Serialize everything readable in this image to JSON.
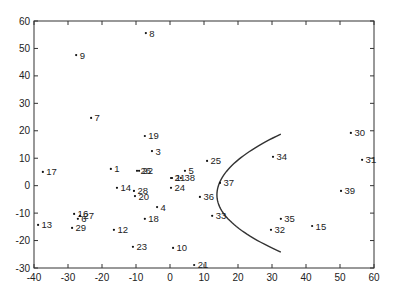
{
  "chart_data": {
    "type": "scatter",
    "title": "",
    "xlabel": "",
    "ylabel": "",
    "xlim": [
      -40,
      60
    ],
    "ylim": [
      -30,
      60
    ],
    "grid": false,
    "legend": null,
    "xticks": [
      -40,
      -30,
      -20,
      -10,
      0,
      10,
      20,
      30,
      40,
      50,
      60
    ],
    "yticks": [
      -30,
      -20,
      -10,
      0,
      10,
      20,
      30,
      40,
      50,
      60
    ],
    "points": [
      {
        "label": "1",
        "x": -17.4,
        "y": 6.1
      },
      {
        "label": "2",
        "x": 0.3,
        "y": 2.8
      },
      {
        "label": "3",
        "x": -5.3,
        "y": 12.6
      },
      {
        "label": "4",
        "x": -3.8,
        "y": -7.8
      },
      {
        "label": "5",
        "x": 4.4,
        "y": 5.4
      },
      {
        "label": "6",
        "x": -27.1,
        "y": -12.1
      },
      {
        "label": "7",
        "x": -23.2,
        "y": 24.7
      },
      {
        "label": "8",
        "x": -7.1,
        "y": 55.6
      },
      {
        "label": "9",
        "x": -27.6,
        "y": 47.6
      },
      {
        "label": "10",
        "x": 0.9,
        "y": -22.7
      },
      {
        "label": "11",
        "x": 0.6,
        "y": 2.8
      },
      {
        "label": "12",
        "x": -16.5,
        "y": -16.1
      },
      {
        "label": "13",
        "x": -38.8,
        "y": -14.3
      },
      {
        "label": "14",
        "x": -15.6,
        "y": -0.8
      },
      {
        "label": "15",
        "x": 41.8,
        "y": -14.7
      },
      {
        "label": "16",
        "x": -28.2,
        "y": -10.3
      },
      {
        "label": "17",
        "x": -37.4,
        "y": 5.0
      },
      {
        "label": "18",
        "x": -7.4,
        "y": -12.1
      },
      {
        "label": "19",
        "x": -7.4,
        "y": 18.1
      },
      {
        "label": "20",
        "x": -10.3,
        "y": -3.8
      },
      {
        "label": "21",
        "x": 7.1,
        "y": -28.9
      },
      {
        "label": "22",
        "x": -9.1,
        "y": 5.4
      },
      {
        "label": "23",
        "x": -10.9,
        "y": -22.3
      },
      {
        "label": "24",
        "x": 0.3,
        "y": -0.8
      },
      {
        "label": "25",
        "x": 10.9,
        "y": 9.0
      },
      {
        "label": "26",
        "x": -9.7,
        "y": 5.4
      },
      {
        "label": "27",
        "x": -26.5,
        "y": -11.0
      },
      {
        "label": "28",
        "x": -10.6,
        "y": -1.9
      },
      {
        "label": "29",
        "x": -28.8,
        "y": -15.4
      },
      {
        "label": "30",
        "x": 53.2,
        "y": 19.2
      },
      {
        "label": "31",
        "x": 56.5,
        "y": 9.4
      },
      {
        "label": "32",
        "x": 29.7,
        "y": -16.1
      },
      {
        "label": "33",
        "x": 12.4,
        "y": -11.0
      },
      {
        "label": "34",
        "x": 30.3,
        "y": 10.5
      },
      {
        "label": "35",
        "x": 32.6,
        "y": -12.1
      },
      {
        "label": "36",
        "x": 8.8,
        "y": -4.1
      },
      {
        "label": "37",
        "x": 14.7,
        "y": 1.0
      },
      {
        "label": "38",
        "x": 3.2,
        "y": 2.8
      },
      {
        "label": "39",
        "x": 50.3,
        "y": -1.9
      }
    ],
    "curve": {
      "type": "parabola-boundary",
      "top": {
        "x": 32.6,
        "y": 18.8
      },
      "vertex": {
        "x": 13.8,
        "y": -3.4
      },
      "bottom": {
        "x": 32.6,
        "y": -24.2
      }
    },
    "colors": {
      "axis": "#333333",
      "point": "#111111",
      "curve": "#333333",
      "text": "#222222"
    }
  }
}
